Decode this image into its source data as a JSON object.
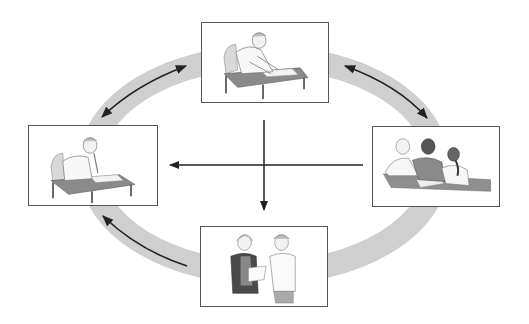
{
  "diagram": {
    "type": "cycle",
    "ring_color": "#cfcfcf",
    "arrow_color": "#222222",
    "panels": [
      {
        "id": "top",
        "scene": "person-writing-at-desk",
        "description": "Student bent over a desk writing"
      },
      {
        "id": "left",
        "scene": "person-thinking-at-desk",
        "description": "Student at desk, chin on hand, thinking"
      },
      {
        "id": "right",
        "scene": "group-discussion",
        "description": "Three students discussing a paper at a table"
      },
      {
        "id": "bottom",
        "scene": "teacher-student-conference",
        "description": "Teacher holding paper talking with a student"
      }
    ],
    "connections": [
      {
        "from": "top",
        "to": "left",
        "style": "double-arrow",
        "path": "ring-top-left"
      },
      {
        "from": "top",
        "to": "right",
        "style": "double-arrow",
        "path": "ring-top-right"
      },
      {
        "from": "bottom",
        "to": "left",
        "style": "single-arrow",
        "path": "ring-bottom-left"
      },
      {
        "from": "right",
        "to": "left",
        "style": "single-arrow",
        "path": "center-horizontal"
      },
      {
        "from": "center",
        "to": "bottom",
        "style": "single-arrow",
        "path": "center-vertical"
      }
    ]
  }
}
